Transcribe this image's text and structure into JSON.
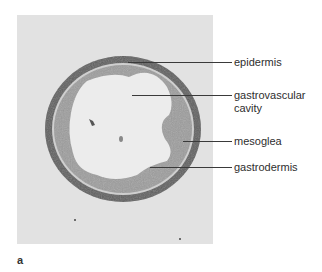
{
  "figure": {
    "panel_letter": "a",
    "labels": [
      {
        "id": "epidermis",
        "text": "epidermis"
      },
      {
        "id": "gastrovascular-cavity",
        "text": "gastrovascular\ncavity"
      },
      {
        "id": "mesoglea",
        "text": "mesoglea"
      },
      {
        "id": "gastrodermis",
        "text": "gastrodermis"
      }
    ]
  },
  "colors": {
    "photo_background": "#e2e2e2",
    "cavity": "#ececec",
    "epidermis_band": "#5a5a5a",
    "gastrodermis_band": "#9a9a9a",
    "label_text": "#2e2e2e",
    "leader_line": "#3a3a3a"
  }
}
